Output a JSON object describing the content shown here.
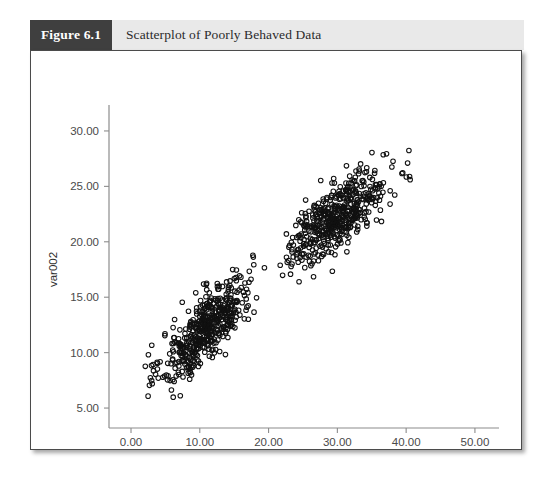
{
  "figure": {
    "number_label": "Figure 6.1",
    "caption": "Scatterplot of Poorly Behaved Data"
  },
  "chart_data": {
    "type": "scatter",
    "title": "Scatterplot of Poorly Behaved Data",
    "xlabel": "var001",
    "ylabel": "var002",
    "xlim": [
      -3.2,
      53.5
    ],
    "ylim": [
      3.2,
      31.8
    ],
    "xticks": [
      0,
      10,
      20,
      30,
      40,
      50
    ],
    "xticklabels": [
      "0.00",
      "10.00",
      "20.00",
      "30.00",
      "40.00",
      "50.00"
    ],
    "yticks": [
      5,
      10,
      15,
      20,
      25,
      30
    ],
    "yticklabels": [
      "5.00",
      "10.00",
      "15.00",
      "20.00",
      "25.00",
      "30.00"
    ],
    "grid": false,
    "legend": false,
    "marker": "open-circle",
    "marker_radius_px": 2.3,
    "marker_color": "#111111",
    "n_points_total": 1000,
    "clusters": [
      {
        "name": "lower-left-cluster",
        "n": 500,
        "x_mean": 11.0,
        "y_mean": 12.3,
        "x_sd": 3.3,
        "y_sd": 2.45,
        "correlation": 0.78,
        "x_range": [
          2.0,
          21.5
        ],
        "y_range": [
          5.8,
          19.5
        ]
      },
      {
        "name": "upper-right-cluster",
        "n": 500,
        "x_mean": 30.0,
        "y_mean": 22.3,
        "x_sd": 3.6,
        "y_sd": 2.1,
        "correlation": 0.74,
        "x_range": [
          21.0,
          41.5
        ],
        "y_range": [
          16.0,
          29.2
        ]
      }
    ],
    "axes_geometry": {
      "x_axis_y_px": 377,
      "y_axis_x_px": 78,
      "x_axis_right_px": 468,
      "y_axis_top_px": 60,
      "x_pixels_per_unit": 7.3,
      "y_pixels_per_unit": 11.8
    }
  }
}
